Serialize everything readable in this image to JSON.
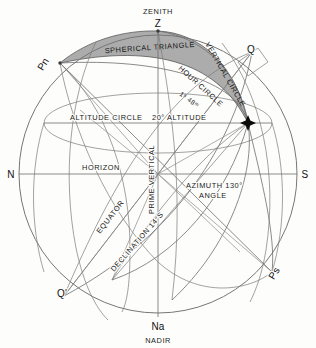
{
  "diagram": {
    "type": "astronomical-diagram",
    "points": {
      "zenith_name": "ZENITH",
      "zenith_symbol": "Z",
      "nadir_symbol": "Na",
      "nadir_name": "NADIR",
      "north_point": "N",
      "south_point": "S",
      "north_pole": "Pn",
      "south_pole": "Ps",
      "equator_east": "Q",
      "equator_west": "Q'"
    },
    "labels": {
      "spherical_triangle": "SPHERICAL TRIANGLE",
      "vertical_circle": "VERTICAL CIRCLE",
      "hour_circle": "HOUR CIRCLE",
      "hour_angle_value": "1ʰ 48ᵐ",
      "altitude_circle": "ALTITUDE CIRCLE",
      "altitude_value": "20° ALTITUDE",
      "horizon": "HORIZON",
      "prime_vertical": "PRIME VERTICAL",
      "azimuth_line1": "AZIMUTH  130°",
      "azimuth_line2": "ANGLE",
      "equator": "EQUATOR",
      "declination": "DECLINATION 14°S"
    },
    "colors": {
      "background": "#fdfdfc",
      "line": "#6d6d6d",
      "shade": "#9a9a9a",
      "text": "#1a1a1a"
    }
  }
}
